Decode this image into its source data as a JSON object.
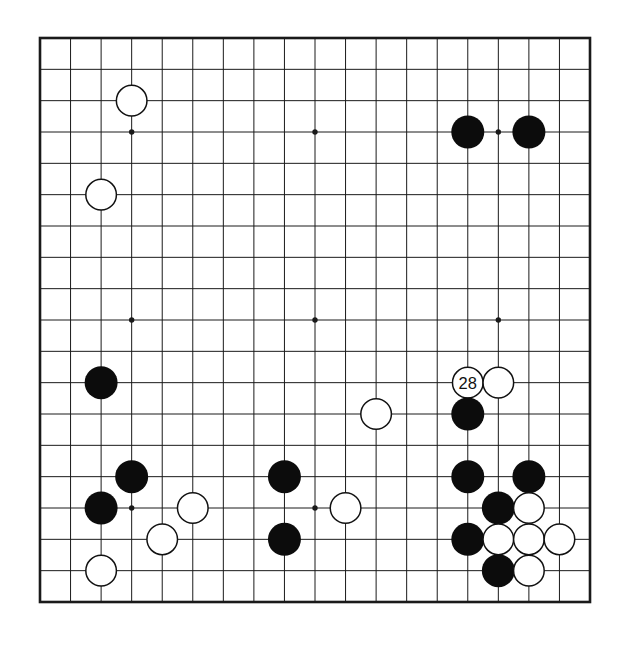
{
  "board": {
    "size": 19,
    "move_label": "28",
    "colors": {
      "background": "#ffffff",
      "line": "#1a1a1a",
      "black_stone": "#0c0c0c",
      "white_stone": "#ffffff",
      "stone_outline": "#111111",
      "label_text": "#111111"
    },
    "star_points": [
      {
        "col": 4,
        "row": 4
      },
      {
        "col": 10,
        "row": 4
      },
      {
        "col": 16,
        "row": 4
      },
      {
        "col": 4,
        "row": 10
      },
      {
        "col": 10,
        "row": 10
      },
      {
        "col": 16,
        "row": 10
      },
      {
        "col": 4,
        "row": 16
      },
      {
        "col": 10,
        "row": 16
      },
      {
        "col": 16,
        "row": 16
      }
    ],
    "stones": [
      {
        "col": 4,
        "row": 3,
        "color": "white"
      },
      {
        "col": 15,
        "row": 4,
        "color": "black"
      },
      {
        "col": 17,
        "row": 4,
        "color": "black"
      },
      {
        "col": 3,
        "row": 6,
        "color": "white"
      },
      {
        "col": 3,
        "row": 12,
        "color": "black"
      },
      {
        "col": 15,
        "row": 12,
        "color": "white",
        "label": "28"
      },
      {
        "col": 16,
        "row": 12,
        "color": "white"
      },
      {
        "col": 12,
        "row": 13,
        "color": "white"
      },
      {
        "col": 15,
        "row": 13,
        "color": "black"
      },
      {
        "col": 4,
        "row": 15,
        "color": "black"
      },
      {
        "col": 9,
        "row": 15,
        "color": "black"
      },
      {
        "col": 15,
        "row": 15,
        "color": "black"
      },
      {
        "col": 17,
        "row": 15,
        "color": "black"
      },
      {
        "col": 3,
        "row": 16,
        "color": "black"
      },
      {
        "col": 6,
        "row": 16,
        "color": "white"
      },
      {
        "col": 11,
        "row": 16,
        "color": "white"
      },
      {
        "col": 16,
        "row": 16,
        "color": "black"
      },
      {
        "col": 17,
        "row": 16,
        "color": "white"
      },
      {
        "col": 5,
        "row": 17,
        "color": "white"
      },
      {
        "col": 9,
        "row": 17,
        "color": "black"
      },
      {
        "col": 15,
        "row": 17,
        "color": "black"
      },
      {
        "col": 16,
        "row": 17,
        "color": "white"
      },
      {
        "col": 17,
        "row": 17,
        "color": "white"
      },
      {
        "col": 18,
        "row": 17,
        "color": "white"
      },
      {
        "col": 3,
        "row": 18,
        "color": "white"
      },
      {
        "col": 16,
        "row": 18,
        "color": "black"
      },
      {
        "col": 17,
        "row": 18,
        "color": "white"
      }
    ]
  }
}
